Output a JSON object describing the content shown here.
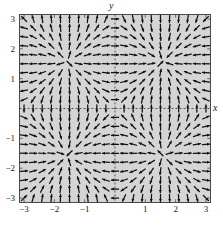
{
  "figure": {
    "kind": "vector-field-plot",
    "background_color": "#ffffff",
    "plot_background_color": "#d5d5d5",
    "frame_color": "#4a4a4a",
    "arrow_color": "#111111",
    "axis_line_color": "#333333",
    "axis_line_style": "dashed"
  },
  "axes": {
    "x_label": "x",
    "y_label": "y",
    "x_tick_labels": [
      "-3",
      "-2",
      "-1",
      "1",
      "2",
      "3"
    ],
    "x_tick_values": [
      -3,
      -2,
      -1,
      1,
      2,
      3
    ],
    "y_tick_labels": [
      "3",
      "2",
      "1",
      "-1",
      "-2",
      "-3"
    ],
    "y_tick_values": [
      3,
      2,
      1,
      -1,
      -2,
      -3
    ],
    "xlim": [
      -3.15,
      3.15
    ],
    "ylim": [
      -3.15,
      3.15
    ],
    "grid": false
  },
  "chart_data": {
    "type": "scatter",
    "subtype": "quiver-direction-field",
    "title": "",
    "xlabel": "x",
    "ylabel": "y",
    "xlim": [
      -3.15,
      3.15
    ],
    "ylim": [
      -3.15,
      3.15
    ],
    "grid": false,
    "legend": null,
    "grid_columns": 21,
    "grid_rows": 21,
    "grid_x_start": -3.0,
    "grid_x_step": 0.3,
    "grid_y_start": -3.0,
    "grid_y_step": 0.3,
    "arrows_normalized": true,
    "arrow_pixel_length": 7.2,
    "field": {
      "u_expression": "sin(y) * cos(x)",
      "v_expression": "sin(x) * cos(y)",
      "description": "Normalized direction field with rotational cells and saddle points on a 21 by 21 grid over -3 to 3 in both x and y."
    }
  }
}
